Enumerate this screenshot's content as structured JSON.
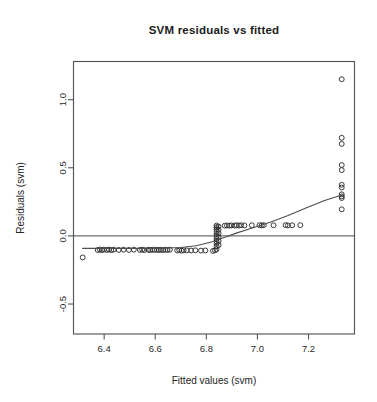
{
  "chart_data": {
    "type": "scatter",
    "title": "SVM residuals vs fitted",
    "xlabel": "Fitted values (svm)",
    "ylabel": "Residuals (svm)",
    "grid": false,
    "legend": "none",
    "xlim": [
      6.28,
      7.38
    ],
    "ylim": [
      -0.72,
      1.28
    ],
    "xticks": [
      6.4,
      6.6,
      6.8,
      7.0,
      7.2
    ],
    "xtick_labels": [
      "6.4",
      "6.6",
      "6.8",
      "7.0",
      "7.2"
    ],
    "yticks": [
      -0.5,
      0.0,
      0.5,
      1.0
    ],
    "ytick_labels": [
      "-0.5",
      "0.0",
      "0.5",
      "1.0"
    ],
    "reference_line": {
      "orientation": "horizontal",
      "y": 0.0
    },
    "points": [
      [
        6.316,
        -0.158
      ],
      [
        6.375,
        -0.104
      ],
      [
        6.383,
        -0.1
      ],
      [
        6.391,
        -0.104
      ],
      [
        6.399,
        -0.101
      ],
      [
        6.411,
        -0.103
      ],
      [
        6.419,
        -0.1
      ],
      [
        6.428,
        -0.104
      ],
      [
        6.437,
        -0.101
      ],
      [
        6.457,
        -0.103
      ],
      [
        6.476,
        -0.101
      ],
      [
        6.497,
        -0.103
      ],
      [
        6.516,
        -0.101
      ],
      [
        6.54,
        -0.103
      ],
      [
        6.549,
        -0.101
      ],
      [
        6.557,
        -0.104
      ],
      [
        6.572,
        -0.102
      ],
      [
        6.58,
        -0.104
      ],
      [
        6.589,
        -0.101
      ],
      [
        6.597,
        -0.103
      ],
      [
        6.606,
        -0.101
      ],
      [
        6.614,
        -0.104
      ],
      [
        6.622,
        -0.102
      ],
      [
        6.631,
        -0.104
      ],
      [
        6.64,
        -0.101
      ],
      [
        6.648,
        -0.103
      ],
      [
        6.657,
        -0.101
      ],
      [
        6.686,
        -0.107
      ],
      [
        6.694,
        -0.104
      ],
      [
        6.703,
        -0.108
      ],
      [
        6.711,
        -0.105
      ],
      [
        6.724,
        -0.106
      ],
      [
        6.74,
        -0.107
      ],
      [
        6.757,
        -0.106
      ],
      [
        6.779,
        -0.108
      ],
      [
        6.796,
        -0.107
      ],
      [
        6.826,
        -0.11
      ],
      [
        6.834,
        -0.106
      ],
      [
        6.84,
        -0.098
      ],
      [
        6.84,
        -0.077
      ],
      [
        6.84,
        -0.057
      ],
      [
        6.84,
        -0.04
      ],
      [
        6.84,
        -0.022
      ],
      [
        6.84,
        -0.004
      ],
      [
        6.84,
        0.014
      ],
      [
        6.84,
        0.033
      ],
      [
        6.84,
        0.05
      ],
      [
        6.84,
        0.064
      ],
      [
        6.84,
        0.076
      ],
      [
        6.848,
        0.068
      ],
      [
        6.848,
        0.045
      ],
      [
        6.848,
        0.02
      ],
      [
        6.848,
        -0.01
      ],
      [
        6.848,
        -0.038
      ],
      [
        6.848,
        -0.068
      ],
      [
        6.872,
        0.075
      ],
      [
        6.881,
        0.077
      ],
      [
        6.89,
        0.075
      ],
      [
        6.898,
        0.077
      ],
      [
        6.911,
        0.076
      ],
      [
        6.919,
        0.078
      ],
      [
        6.928,
        0.076
      ],
      [
        6.936,
        0.078
      ],
      [
        6.949,
        0.077
      ],
      [
        6.978,
        0.078
      ],
      [
        7.008,
        0.079
      ],
      [
        7.017,
        0.077
      ],
      [
        7.025,
        0.079
      ],
      [
        7.063,
        0.078
      ],
      [
        7.11,
        0.079
      ],
      [
        7.119,
        0.077
      ],
      [
        7.136,
        0.078
      ],
      [
        7.168,
        0.079
      ],
      [
        7.33,
        1.15
      ],
      [
        7.33,
        0.72
      ],
      [
        7.33,
        0.675
      ],
      [
        7.33,
        0.52
      ],
      [
        7.33,
        0.483
      ],
      [
        7.33,
        0.375
      ],
      [
        7.33,
        0.355
      ],
      [
        7.33,
        0.305
      ],
      [
        7.33,
        0.29
      ],
      [
        7.33,
        0.278
      ],
      [
        7.33,
        0.195
      ]
    ],
    "smooth_curve": {
      "label": "lowess smooth",
      "x": [
        6.316,
        6.42,
        6.52,
        6.62,
        6.7,
        6.76,
        6.82,
        6.87,
        6.92,
        6.98,
        7.05,
        7.12,
        7.19,
        7.26,
        7.33
      ],
      "y": [
        -0.092,
        -0.092,
        -0.092,
        -0.09,
        -0.085,
        -0.072,
        -0.045,
        -0.012,
        0.022,
        0.058,
        0.1,
        0.15,
        0.205,
        0.258,
        0.3
      ]
    }
  }
}
